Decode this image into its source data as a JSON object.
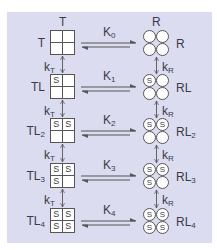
{
  "diagram": {
    "title_tension_top": "T",
    "title_relaxed_top": "R",
    "rows": [
      {
        "t_label": "T",
        "t_sub": "",
        "r_label": "R",
        "r_sub": "",
        "k_label": "K",
        "k_sub": "0",
        "t_cells": [
          "",
          "",
          "",
          ""
        ],
        "r_cells": [
          "",
          "",
          "",
          ""
        ]
      },
      {
        "t_label": "TL",
        "t_sub": "",
        "r_label": "RL",
        "r_sub": "",
        "k_label": "K",
        "k_sub": "1",
        "t_cells": [
          "S",
          "",
          "",
          ""
        ],
        "r_cells": [
          "S",
          "",
          "",
          ""
        ]
      },
      {
        "t_label": "TL",
        "t_sub": "2",
        "r_label": "RL",
        "r_sub": "2",
        "k_label": "K",
        "k_sub": "2",
        "t_cells": [
          "S",
          "S",
          "",
          ""
        ],
        "r_cells": [
          "S",
          "S",
          "",
          ""
        ]
      },
      {
        "t_label": "TL",
        "t_sub": "3",
        "r_label": "RL",
        "r_sub": "3",
        "k_label": "K",
        "k_sub": "3",
        "t_cells": [
          "S",
          "S",
          "S",
          ""
        ],
        "r_cells": [
          "S",
          "S",
          "S",
          ""
        ]
      },
      {
        "t_label": "TL",
        "t_sub": "4",
        "r_label": "RL",
        "r_sub": "4",
        "k_label": "K",
        "k_sub": "4",
        "t_cells": [
          "S",
          "S",
          "S",
          "S"
        ],
        "r_cells": [
          "S",
          "S",
          "S",
          "S"
        ]
      }
    ],
    "kt_label": "k",
    "kt_sub": "T",
    "kr_label": "k",
    "kr_sub": "R",
    "colors": {
      "background": "#dcdcf0",
      "stroke": "#555555",
      "fill": "#ffffff"
    }
  }
}
